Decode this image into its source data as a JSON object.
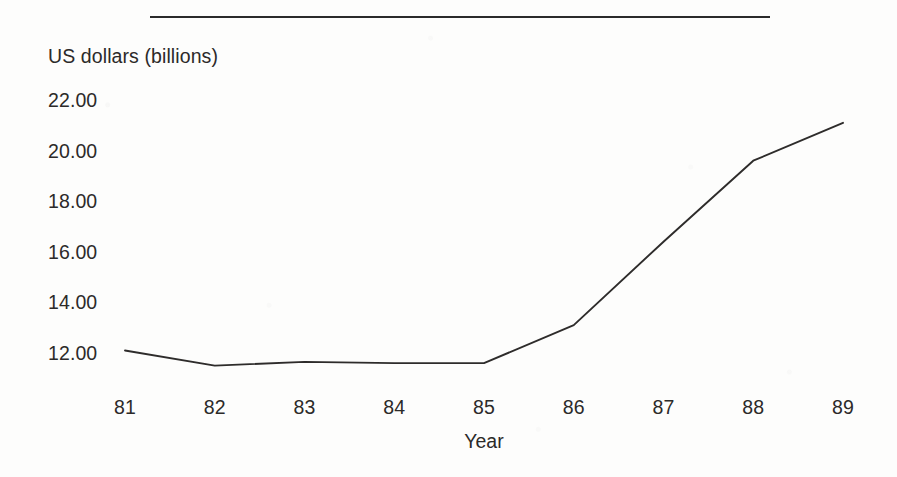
{
  "chart_data": {
    "type": "line",
    "title": "",
    "xlabel": "Year",
    "ylabel": "US dollars (billions)",
    "categories": [
      "81",
      "82",
      "83",
      "84",
      "85",
      "86",
      "87",
      "88",
      "89"
    ],
    "x": [
      81,
      82,
      83,
      84,
      85,
      86,
      87,
      88,
      89
    ],
    "values": [
      12.1,
      11.5,
      11.65,
      11.6,
      11.6,
      13.1,
      16.4,
      19.6,
      21.1
    ],
    "series": [
      {
        "name": "US dollars (billions)",
        "values": [
          12.1,
          11.5,
          11.65,
          11.6,
          11.6,
          13.1,
          16.4,
          19.6,
          21.1
        ]
      }
    ],
    "ytick_labels": [
      "22.00",
      "20.00",
      "18.00",
      "16.00",
      "14.00",
      "12.00"
    ],
    "ytick_values": [
      22,
      20,
      18,
      16,
      14,
      12
    ],
    "xtick_labels": [
      "81",
      "82",
      "83",
      "84",
      "85",
      "86",
      "87",
      "88",
      "89"
    ],
    "ylim": [
      11.0,
      22.6
    ],
    "xlim": [
      81,
      89
    ],
    "grid": false,
    "legend": false,
    "legend_position": "none",
    "line_color": "#2e2c2b",
    "text_color": "#2c2a29",
    "background_color": "#fdfdfc",
    "annotations": []
  },
  "decor": {
    "top_rule_name": "top-horizontal-rule"
  }
}
